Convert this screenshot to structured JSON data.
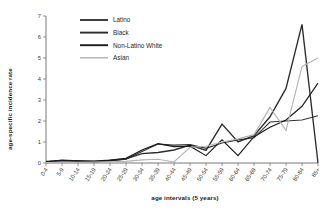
{
  "chart_data": {
    "type": "line",
    "title": "",
    "xlabel": "age intervals (5 years)",
    "ylabel": "age-specific incidence rate",
    "categories": [
      "0-4",
      "5-9",
      "10-14",
      "15-19",
      "20-24",
      "25-29",
      "30-34",
      "35-39",
      "40-44",
      "45-49",
      "50-54",
      "55-59",
      "60-64",
      "65-69",
      "70-74",
      "75-79",
      "80-84",
      "85+"
    ],
    "ylim": [
      0,
      7
    ],
    "yticks": [
      0,
      1,
      2,
      3,
      4,
      5,
      6,
      7
    ],
    "grid": false,
    "legend_position": "top-left",
    "series": [
      {
        "name": "Latino",
        "color": "#333333",
        "values": [
          0.08,
          0.12,
          0.12,
          0.08,
          0.1,
          0.18,
          0.55,
          0.9,
          0.85,
          0.88,
          0.7,
          0.95,
          1.1,
          1.2,
          1.95,
          2.0,
          2.05,
          2.25
        ]
      },
      {
        "name": "Black",
        "color": "#2b2b2b",
        "values": [
          0.05,
          0.1,
          0.08,
          0.05,
          0.12,
          0.2,
          0.45,
          0.5,
          0.62,
          0.85,
          0.6,
          1.85,
          1.0,
          1.3,
          2.2,
          3.55,
          6.6,
          0.0
        ]
      },
      {
        "name": "Non-Latino White",
        "color": "#1a1a1a",
        "values": [
          0.06,
          0.14,
          0.1,
          0.09,
          0.14,
          0.22,
          0.62,
          0.92,
          0.78,
          0.8,
          0.35,
          1.1,
          0.35,
          1.25,
          1.7,
          2.05,
          2.7,
          3.8
        ]
      },
      {
        "name": "Asian",
        "color": "#b4b4b4",
        "values": [
          0.02,
          0.03,
          0.03,
          0.04,
          0.06,
          0.08,
          0.15,
          0.18,
          0.05,
          0.75,
          0.8,
          1.0,
          1.15,
          1.35,
          2.65,
          1.55,
          4.6,
          5.0
        ]
      }
    ]
  },
  "legend": {
    "items": [
      {
        "label": "Latino"
      },
      {
        "label": "Black"
      },
      {
        "label": "Non-Latino White"
      },
      {
        "label": "Asian"
      }
    ]
  }
}
